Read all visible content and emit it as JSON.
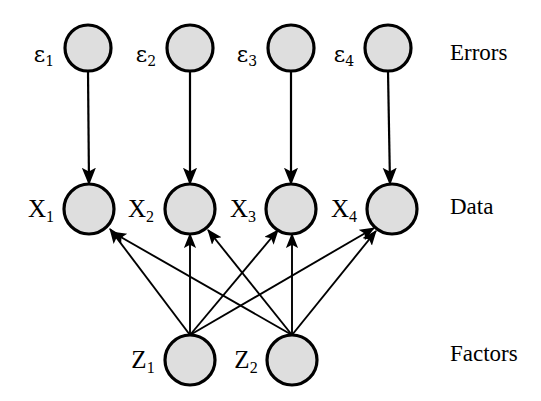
{
  "diagram": {
    "background_color": "#ffffff",
    "node_fill_color": "#dedede",
    "node_stroke_color": "#000000",
    "edge_color": "#000000",
    "row_labels": [
      {
        "id": "row-errors",
        "text": "Errors",
        "x": 450,
        "y": 55
      },
      {
        "id": "row-data",
        "text": "Data",
        "x": 450,
        "y": 209
      },
      {
        "id": "row-factors",
        "text": "Factors",
        "x": 450,
        "y": 356
      }
    ],
    "nodes": {
      "errors": [
        {
          "id": "eps1",
          "label": "ε",
          "subscript": "1",
          "cx": 88,
          "cy": 48,
          "r": 23,
          "label_x": 44,
          "label_y": 56
        },
        {
          "id": "eps2",
          "label": "ε",
          "subscript": "2",
          "cx": 190,
          "cy": 48,
          "r": 23,
          "label_x": 146,
          "label_y": 56
        },
        {
          "id": "eps3",
          "label": "ε",
          "subscript": "3",
          "cx": 291,
          "cy": 48,
          "r": 23,
          "label_x": 247,
          "label_y": 56
        },
        {
          "id": "eps4",
          "label": "ε",
          "subscript": "4",
          "cx": 388,
          "cy": 48,
          "r": 23,
          "label_x": 344,
          "label_y": 56
        }
      ],
      "data": [
        {
          "id": "x1",
          "label": "X",
          "subscript": "1",
          "cx": 89,
          "cy": 209,
          "r": 25,
          "label_x": 41,
          "label_y": 211
        },
        {
          "id": "x2",
          "label": "X",
          "subscript": "2",
          "cx": 190,
          "cy": 209,
          "r": 25,
          "label_x": 141,
          "label_y": 211
        },
        {
          "id": "x3",
          "label": "X",
          "subscript": "3",
          "cx": 291,
          "cy": 209,
          "r": 25,
          "label_x": 243,
          "label_y": 211
        },
        {
          "id": "x4",
          "label": "X",
          "subscript": "4",
          "cx": 392,
          "cy": 209,
          "r": 25,
          "label_x": 344,
          "label_y": 211
        }
      ],
      "factors": [
        {
          "id": "z1",
          "label": "Z",
          "subscript": "1",
          "cx": 190,
          "cy": 360,
          "r": 25,
          "label_x": 143,
          "label_y": 362
        },
        {
          "id": "z2",
          "label": "Z",
          "subscript": "2",
          "cx": 292,
          "cy": 360,
          "r": 25,
          "label_x": 246,
          "label_y": 362
        }
      ]
    },
    "edges": {
      "error_to_data": [
        {
          "id": "eps1-x1",
          "from": "eps1",
          "to": "x1",
          "x1": 88,
          "y1": 71,
          "x2": 89,
          "y2": 184
        },
        {
          "id": "eps2-x2",
          "from": "eps2",
          "to": "x2",
          "x1": 190,
          "y1": 71,
          "x2": 190,
          "y2": 184
        },
        {
          "id": "eps3-x3",
          "from": "eps3",
          "to": "x3",
          "x1": 291,
          "y1": 71,
          "x2": 291,
          "y2": 184
        },
        {
          "id": "eps4-x4",
          "from": "eps4",
          "to": "x4",
          "x1": 388,
          "y1": 71,
          "x2": 390,
          "y2": 184
        }
      ],
      "factor_to_data": [
        {
          "id": "z1-x1",
          "from": "z1",
          "to": "x1",
          "x1": 190,
          "y1": 335,
          "x2": 110,
          "y2": 229
        },
        {
          "id": "z1-x2",
          "from": "z1",
          "to": "x2",
          "x1": 190,
          "y1": 335,
          "x2": 190,
          "y2": 234
        },
        {
          "id": "z1-x3",
          "from": "z1",
          "to": "x3",
          "x1": 190,
          "y1": 335,
          "x2": 278,
          "y2": 230
        },
        {
          "id": "z1-x4",
          "from": "z1",
          "to": "x4",
          "x1": 190,
          "y1": 335,
          "x2": 374,
          "y2": 228
        },
        {
          "id": "z2-x1",
          "from": "z2",
          "to": "x1",
          "x1": 292,
          "y1": 335,
          "x2": 112,
          "y2": 232
        },
        {
          "id": "z2-x2",
          "from": "z2",
          "to": "x2",
          "x1": 292,
          "y1": 335,
          "x2": 208,
          "y2": 230
        },
        {
          "id": "z2-x3",
          "from": "z2",
          "to": "x3",
          "x1": 292,
          "y1": 335,
          "x2": 292,
          "y2": 234
        },
        {
          "id": "z2-x4",
          "from": "z2",
          "to": "x4",
          "x1": 292,
          "y1": 335,
          "x2": 376,
          "y2": 231
        }
      ]
    }
  }
}
